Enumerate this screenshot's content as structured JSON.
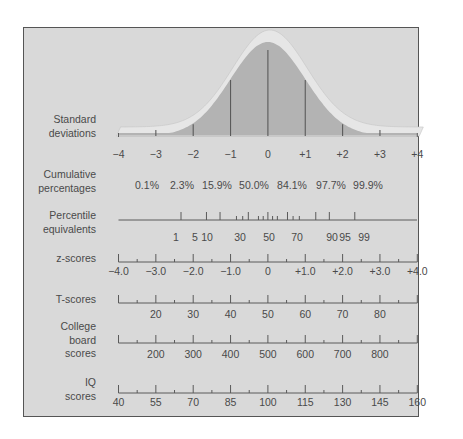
{
  "chart_data": {
    "type": "diagram",
    "curve": {
      "label": [
        "Standard",
        "deviations"
      ],
      "ticks": [
        "−4",
        "−3",
        "−2",
        "−1",
        "0",
        "+1",
        "+2",
        "+3",
        "+4"
      ],
      "values": [
        -4,
        -3,
        -2,
        -1,
        0,
        1,
        2,
        3,
        4
      ]
    },
    "rows": [
      {
        "name": "cumulative-percentages",
        "label": [
          "Cumulative",
          "percentages"
        ],
        "values": [
          "0.1%",
          "2.3%",
          "15.9%",
          "50.0%",
          "84.1%",
          "97.7%",
          "99.9%"
        ],
        "positions_sd": [
          -3,
          -2,
          -1,
          0,
          1,
          2,
          3
        ]
      },
      {
        "name": "percentile-equivalents",
        "label": [
          "Percentile",
          "equivalents"
        ],
        "labels": [
          "1",
          "5",
          "10",
          "30",
          "50",
          "70",
          "90",
          "95",
          "99"
        ],
        "label_percentiles": [
          1,
          5,
          10,
          30,
          50,
          70,
          90,
          95,
          99
        ],
        "tick_percentiles": [
          1,
          5,
          10,
          20,
          25,
          30,
          40,
          45,
          50,
          55,
          60,
          70,
          75,
          80,
          90,
          95,
          99
        ]
      },
      {
        "name": "z-scores",
        "label": [
          "z-scores"
        ],
        "labels": [
          "−4.0",
          "−3.0",
          "−2.0",
          "−1.0",
          "0",
          "+1.0",
          "+2.0",
          "+3.0",
          "+4.0"
        ],
        "label_sd": [
          -4,
          -3,
          -2,
          -1,
          0,
          1,
          2,
          3,
          4
        ]
      },
      {
        "name": "t-scores",
        "label": [
          "T-scores"
        ],
        "labels": [
          "20",
          "30",
          "40",
          "50",
          "60",
          "70",
          "80"
        ],
        "label_sd": [
          -3,
          -2,
          -1,
          0,
          1,
          2,
          3
        ]
      },
      {
        "name": "college-board-scores",
        "label": [
          "College",
          "board",
          "scores"
        ],
        "labels": [
          "200",
          "300",
          "400",
          "500",
          "600",
          "700",
          "800"
        ],
        "label_sd": [
          -3,
          -2,
          -1,
          0,
          1,
          2,
          3
        ]
      },
      {
        "name": "iq-scores",
        "label": [
          "IQ",
          "scores"
        ],
        "labels": [
          "40",
          "55",
          "70",
          "85",
          "100",
          "115",
          "130",
          "145",
          "160"
        ],
        "label_sd": [
          -4,
          -3,
          -2,
          -1,
          0,
          1,
          2,
          3,
          4
        ]
      }
    ],
    "colors": {
      "panel": "#d9d9d9",
      "curve_fill": "#b3b3b3",
      "curve_rim": "#e6e6e6",
      "line": "#5a5a5a",
      "text": "#4a4a4a"
    }
  }
}
